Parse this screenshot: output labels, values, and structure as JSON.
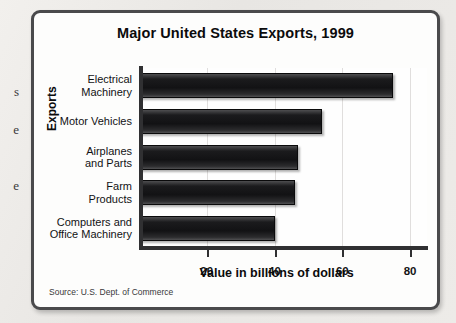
{
  "page": {
    "margin_fragments": [
      "s",
      "e",
      "e"
    ]
  },
  "chart_data": {
    "type": "bar",
    "orientation": "horizontal",
    "title": "Major United States Exports, 1999",
    "xlabel": "Value in billions of dollars",
    "ylabel": "Exports",
    "categories": [
      "Electrical Machinery",
      "Motor Vehicles",
      "Airplanes and Parts",
      "Farm Products",
      "Computers and Office Machinery"
    ],
    "category_lines": [
      [
        "Electrical",
        "Machinery"
      ],
      [
        "Motor Vehicles"
      ],
      [
        "Airplanes",
        "and Parts"
      ],
      [
        "Farm",
        "Products"
      ],
      [
        "Computers and",
        "Office Machinery"
      ]
    ],
    "values": [
      75,
      54,
      47,
      46,
      40
    ],
    "xlim": [
      0,
      85
    ],
    "xticks": [
      20,
      40,
      60,
      80
    ],
    "xtick_labels": [
      "20",
      "40",
      "60",
      "80"
    ],
    "grid": true,
    "legend": false,
    "bar_color": "#141416"
  },
  "source": "Source: U.S. Dept. of Commerce"
}
